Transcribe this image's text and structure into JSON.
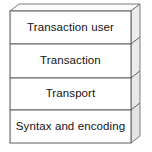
{
  "diagram": {
    "type": "layered-stack-3d",
    "orientation": "vertical-top-to-bottom",
    "layer_count": 4,
    "layers": [
      {
        "label": "Transaction user",
        "position": 1
      },
      {
        "label": "Transaction",
        "position": 2
      },
      {
        "label": "Transport",
        "position": 3
      },
      {
        "label": "Syntax and encoding",
        "position": 4
      }
    ],
    "colors": {
      "background": "#ffffff",
      "face_fill": "#ffffff",
      "outline": "#5a5a5a",
      "outline_light": "#8f8f8f",
      "side_panel_fill": "#efefef",
      "side_panel_shadow": "#d0d0d0",
      "top_face_fill": "#fbfbfb",
      "text": "#141414"
    }
  }
}
